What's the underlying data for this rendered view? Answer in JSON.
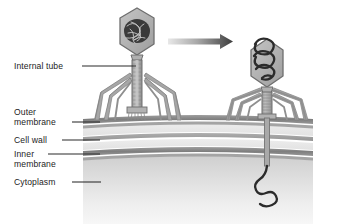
{
  "figure": {
    "type": "diagram",
    "background_color": "#ffffff"
  },
  "labels": [
    {
      "id": "internal-tube",
      "text": "Internal tube",
      "x": 14,
      "y": 61,
      "leader": {
        "x1": 82,
        "y1": 66,
        "x2": 137,
        "y2": 66
      }
    },
    {
      "id": "outer-membrane",
      "text": "Outer\nmembrane",
      "x": 14,
      "y": 107,
      "leader": {
        "x1": 72,
        "y1": 122,
        "x2": 99,
        "y2": 122
      }
    },
    {
      "id": "cell-wall",
      "text": "Cell wall",
      "x": 14,
      "y": 136,
      "leader": {
        "x1": 62,
        "y1": 140,
        "x2": 99,
        "y2": 140
      }
    },
    {
      "id": "inner-membrane",
      "text": "Inner\nmembrane",
      "x": 14,
      "y": 150,
      "leader": {
        "x1": 48,
        "y1": 154,
        "x2": 99,
        "y2": 154
      }
    },
    {
      "id": "cytoplasm",
      "text": "Cytoplasm",
      "x": 14,
      "y": 178,
      "leader": {
        "x1": 72,
        "y1": 182,
        "x2": 101,
        "y2": 182
      }
    }
  ],
  "label_text": {
    "internal_tube": "Internal tube",
    "outer_membrane_line1": "Outer",
    "outer_membrane_line2": "membrane",
    "cell_wall": "Cell wall",
    "inner_membrane_line1": "Inner",
    "inner_membrane_line2": "membrane",
    "cytoplasm": "Cytoplasm"
  },
  "colors": {
    "text": "#1d1d1d",
    "leader_line": "#2a2a2a",
    "capsid_fill": "#b3b3b3",
    "capsid_stroke": "#6e6e6e",
    "dna_dark": "#2b2b2b",
    "sheath_fill": "#a9a9a9",
    "sheath_stroke": "#707070",
    "fiber": "#9a9a9a",
    "fiber_stroke": "#7d7d7d",
    "outer_membrane": "#8a8a8a",
    "cell_wall": "#9b9b9b",
    "inner_membrane": "#8a8a8a",
    "periplasm": "#d8d8d8",
    "cytoplasm_top": "#d3d3d3",
    "cytoplasm_bottom": "#f2f2f2",
    "arrow": "#4a4a4a"
  },
  "cell": {
    "left": 83,
    "right": 313,
    "outer_membrane_y": 120,
    "cell_wall_y": 139,
    "inner_membrane_y": 153,
    "cytoplasm_top_y": 160,
    "bottom": 224
  },
  "panels": [
    {
      "id": "before-injection",
      "state": "phage attached, DNA packaged in capsid, tail sheath extended",
      "phage_head_center_x": 137,
      "phage_head_center_y": 31,
      "dna_state": "coiled inside capsid"
    },
    {
      "id": "after-injection",
      "state": "tail tube penetrates envelope, DNA ejected into cytoplasm",
      "phage_head_center_x": 267,
      "phage_head_center_y": 62,
      "dna_state": "uncoiling out of capsid into cytoplasm"
    }
  ],
  "arrow": {
    "label": "process-arrow",
    "direction": "right",
    "x1": 168,
    "y1": 41,
    "x2": 231,
    "y2": 41
  }
}
